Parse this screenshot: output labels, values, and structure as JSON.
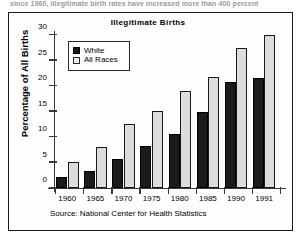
{
  "top_caption": "since 1960, illegitimate birth rates have increased more than 400 percent",
  "figure": {
    "legend": {
      "items": [
        {
          "label": "White",
          "swatch": "filled-black-swatch"
        },
        {
          "label": "All Races",
          "swatch": "open-light-swatch"
        }
      ]
    },
    "source_note": "Source: National Center for Health Statistics"
  },
  "chart_data": {
    "type": "bar",
    "title": "Illegitimate  Births",
    "xlabel": "",
    "ylabel": "Percentage of All Births",
    "categories": [
      "1960",
      "1965",
      "1970",
      "1975",
      "1980",
      "1985",
      "1990",
      "1991"
    ],
    "series": [
      {
        "name": "White",
        "color": "#1a1a1a",
        "values": [
          2.2,
          3.4,
          5.6,
          8.2,
          10.5,
          15.0,
          20.8,
          21.6
        ]
      },
      {
        "name": "All Races",
        "color": "#dcdcdc",
        "values": [
          5.1,
          8.0,
          12.6,
          15.1,
          19.0,
          21.8,
          27.5,
          30.0
        ]
      }
    ],
    "ylim": [
      0,
      30
    ],
    "yticks": [
      0,
      5,
      10,
      15,
      20,
      25,
      30
    ],
    "ytick_labels": [
      "0",
      "5",
      "10",
      "15",
      "20",
      "25",
      "30"
    ],
    "grid": false,
    "legend_position": "upper-left-inside"
  }
}
